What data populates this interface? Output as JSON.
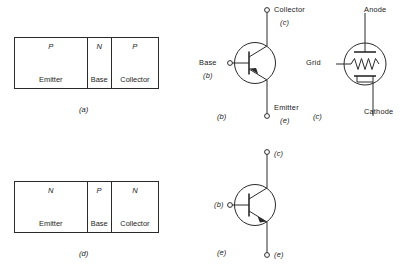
{
  "figure": {
    "panels": [
      {
        "id": "a",
        "caption": "(a)",
        "kind": "slab-diagram",
        "device": "pnp",
        "regions": [
          {
            "type": "P",
            "name": "Emitter"
          },
          {
            "type": "N",
            "name": "Base"
          },
          {
            "type": "P",
            "name": "Collector"
          }
        ]
      },
      {
        "id": "b",
        "caption": "(b)",
        "kind": "transistor-symbol",
        "device": "pnp",
        "terminals": [
          {
            "name": "Collector",
            "letter": "(c)"
          },
          {
            "name": "Base",
            "letter": "(b)"
          },
          {
            "name": "Emitter",
            "letter": "(e)"
          }
        ]
      },
      {
        "id": "c",
        "caption": "(c)",
        "kind": "vacuum-tube-symbol",
        "device": "triode",
        "terminals": [
          {
            "name": "Anode"
          },
          {
            "name": "Grid"
          },
          {
            "name": "Cathode"
          }
        ]
      },
      {
        "id": "d",
        "caption": "(d)",
        "kind": "slab-diagram",
        "device": "npn",
        "regions": [
          {
            "type": "N",
            "name": "Emitter"
          },
          {
            "type": "P",
            "name": "Base"
          },
          {
            "type": "N",
            "name": "Collector"
          }
        ]
      },
      {
        "id": "e",
        "caption": "(e)",
        "kind": "transistor-symbol",
        "device": "npn",
        "terminals": [
          {
            "name": "",
            "letter": "(c)"
          },
          {
            "name": "",
            "letter": "(b)"
          },
          {
            "name": "",
            "letter": "(e)"
          }
        ]
      }
    ]
  },
  "colors": {
    "ink": "#2a2a2a",
    "background": "#ffffff"
  }
}
